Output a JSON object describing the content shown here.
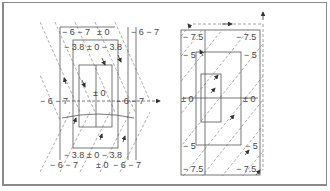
{
  "figure": {
    "colors": {
      "line": "#555555",
      "dashed": "#8a8a8a",
      "frame": "#8a8a8a",
      "text": "#444444"
    }
  },
  "left_diagram": {
    "labels": {
      "top_outer_left": "− 6 − 7",
      "top_outer_mid": "± 0",
      "top_outer_right": "− 6 − 7",
      "top_inner": "− 3.8  ± 0  − 3.8",
      "center": "± 0",
      "mid_left": "− 6 − 7",
      "mid_right": "− 6 − 7",
      "bottom_inner": "− 3.8 ± 0 − 3.8",
      "bottom_outer_left": "− 6 − 7",
      "bottom_outer_mid": "± 0",
      "bottom_outer_right": "− 6 − 7"
    }
  },
  "right_diagram": {
    "labels": {
      "top_left": "− 7.5",
      "top_right": "− 7.5",
      "upper_left": "− 5",
      "upper_right": "− 5",
      "mid_left": "± 0",
      "mid_right": "± 0",
      "lower_left": "− 5",
      "lower_right": "− 5",
      "bottom_left": "− 7.5",
      "bottom_right": "− 7.5"
    }
  }
}
